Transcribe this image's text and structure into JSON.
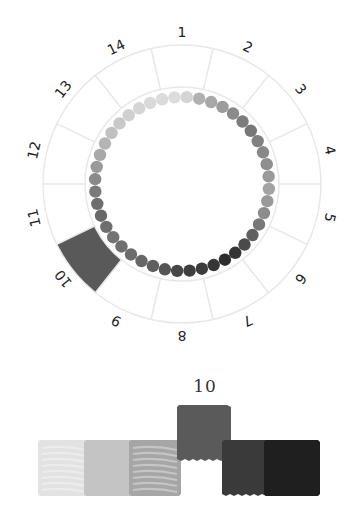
{
  "wheel": {
    "segments": [
      "1",
      "2",
      "3",
      "4",
      "5",
      "6",
      "7",
      "8",
      "9",
      "10",
      "11",
      "12",
      "13",
      "14"
    ],
    "selected_segment": "10",
    "selected_color": "#595959",
    "ring_line_color": "#e6e6e6",
    "dot_colors": [
      "#dcdcdc",
      "#d4d4d4",
      "#b0b0b0",
      "#a8a8a8",
      "#9c9c9c",
      "#8a8a8a",
      "#7c7c7c",
      "#777777",
      "#808080",
      "#888888",
      "#8f8f8f",
      "#9a9a9a",
      "#a3a3a3",
      "#9a9a9a",
      "#8c8c8c",
      "#777777",
      "#606060",
      "#4a4a4a",
      "#353535",
      "#2e2e2e",
      "#363636",
      "#3c3c3c",
      "#3e3e3e",
      "#474747",
      "#555555",
      "#5f5f5f",
      "#666666",
      "#6c6c6c",
      "#707070",
      "#747474",
      "#6e6e6e",
      "#676767",
      "#6e6e6e",
      "#7a7a7a",
      "#8a8a8a",
      "#9a9a9a",
      "#a8a8a8",
      "#b5b5b5",
      "#c0c0c0",
      "#c9c9c9",
      "#d0d0d0",
      "#d5d5d5",
      "#d9d9d9",
      "#dbdbdb"
    ]
  },
  "selection": {
    "caption": "10",
    "swatches": [
      {
        "name": "lightest",
        "color": "#e2e2e2",
        "striped": true
      },
      {
        "name": "light",
        "color": "#c4c4c4",
        "striped": false
      },
      {
        "name": "medium",
        "color": "#a6a6a6",
        "striped": true
      },
      {
        "name": "selected",
        "color": "#5a5a5a",
        "striped": false
      },
      {
        "name": "dark",
        "color": "#3a3a3a",
        "striped": false
      },
      {
        "name": "darkest",
        "color": "#1f1f1f",
        "striped": false
      }
    ]
  }
}
